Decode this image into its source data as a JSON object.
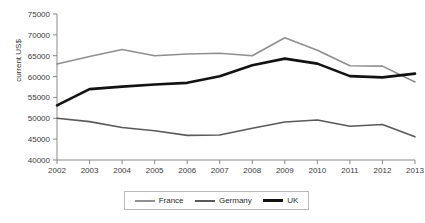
{
  "chart_data": {
    "type": "line",
    "title": "",
    "xlabel": "",
    "ylabel": "current US$",
    "categories": [
      "2002",
      "2003",
      "2004",
      "2005",
      "2006",
      "2007",
      "2008",
      "2009",
      "2010",
      "2011",
      "2012",
      "2013"
    ],
    "x": [
      2002,
      2003,
      2004,
      2005,
      2006,
      2007,
      2008,
      2009,
      2010,
      2011,
      2012,
      2013
    ],
    "ylim": [
      40000,
      75000
    ],
    "ytick_step": 5000,
    "yticks": [
      40000,
      45000,
      50000,
      55000,
      60000,
      65000,
      70000,
      75000
    ],
    "ytick_labels": [
      "40000",
      "45000",
      "50000",
      "55000",
      "60000",
      "65000",
      "70000",
      "75000"
    ],
    "grid": false,
    "legend_position": "bottom",
    "series": [
      {
        "name": "France",
        "color": "#8f8f8f",
        "width": 1.6,
        "values": [
          63000,
          64800,
          66500,
          65000,
          65400,
          65600,
          65000,
          69300,
          66300,
          62600,
          62500,
          58700
        ]
      },
      {
        "name": "Germany",
        "color": "#5a5a5a",
        "width": 1.6,
        "values": [
          50000,
          49200,
          47800,
          47000,
          45900,
          46000,
          47600,
          49100,
          49600,
          48100,
          48500,
          45600
        ]
      },
      {
        "name": "UK",
        "color": "#121212",
        "width": 2.6,
        "values": [
          53100,
          57000,
          57600,
          58100,
          58500,
          60100,
          62700,
          64300,
          63100,
          60100,
          59800,
          60700
        ]
      }
    ]
  },
  "legend": {
    "items": [
      {
        "label": "France"
      },
      {
        "label": "Germany"
      },
      {
        "label": "UK"
      }
    ]
  }
}
